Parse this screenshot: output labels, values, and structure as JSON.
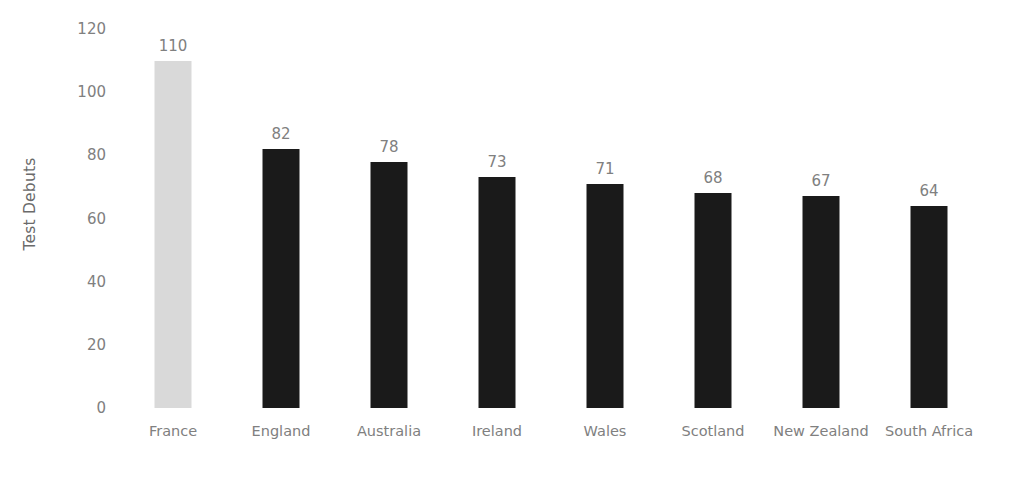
{
  "chart_data": {
    "type": "bar",
    "title": "",
    "subtitle": "",
    "xlabel": "",
    "ylabel": "Test Debuts",
    "categories": [
      "France",
      "England",
      "Australia",
      "Ireland",
      "Wales",
      "Scotland",
      "New Zealand",
      "South Africa"
    ],
    "values": [
      110,
      82,
      78,
      73,
      71,
      68,
      67,
      64
    ],
    "data_labels": [
      "110",
      "82",
      "78",
      "73",
      "71",
      "68",
      "67",
      "64"
    ],
    "bar_colors": [
      "#d9d9d9",
      "#1a1a1a",
      "#1a1a1a",
      "#1a1a1a",
      "#1a1a1a",
      "#1a1a1a",
      "#1a1a1a",
      "#1a1a1a"
    ],
    "highlighted_category": "France",
    "ylim": [
      0,
      120
    ],
    "y_ticks": [
      0,
      20,
      40,
      60,
      80,
      100,
      120
    ],
    "y_tick_labels": [
      "0",
      "20",
      "40",
      "60",
      "80",
      "100",
      "120"
    ],
    "grid": false,
    "legend": false,
    "legend_position": "none",
    "axis_line": false,
    "background_color": "#ffffff",
    "label_color": "#808080"
  }
}
